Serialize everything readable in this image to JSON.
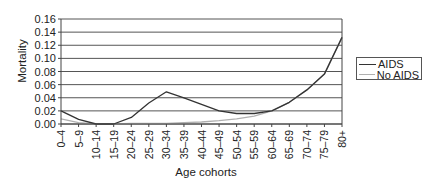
{
  "chart_data": {
    "type": "line",
    "title": "",
    "xlabel": "Age cohorts",
    "ylabel": "Mortality",
    "ylim": [
      0,
      0.16
    ],
    "yticks": [
      "0.00",
      "0.02",
      "0.04",
      "0.06",
      "0.08",
      "0.10",
      "0.12",
      "0.14",
      "0.16"
    ],
    "grid": true,
    "legend_position": "right",
    "categories": [
      "0–4",
      "5–9",
      "10–14",
      "15–19",
      "20–24",
      "25–29",
      "30–34",
      "35–39",
      "40–44",
      "45–49",
      "50–54",
      "55–59",
      "60–64",
      "65–69",
      "70–74",
      "75–79",
      "80+"
    ],
    "series": [
      {
        "name": "AIDS",
        "color": "#333333",
        "values": [
          0.02,
          0.007,
          0.0,
          0.0,
          0.01,
          0.032,
          0.049,
          0.04,
          0.03,
          0.02,
          0.016,
          0.016,
          0.02,
          0.033,
          0.052,
          0.076,
          0.132
        ]
      },
      {
        "name": "No AIDS",
        "color": "#b0b0b0",
        "values": [
          0.008,
          0.002,
          0.0,
          0.0,
          0.001,
          0.001,
          0.001,
          0.002,
          0.003,
          0.005,
          0.008,
          0.012,
          0.02,
          0.033,
          0.052,
          0.076,
          0.132
        ]
      }
    ]
  },
  "legend": {
    "items": [
      {
        "label": "AIDS",
        "color": "#333333"
      },
      {
        "label": "No AIDS",
        "color": "#b0b0b0"
      }
    ]
  }
}
